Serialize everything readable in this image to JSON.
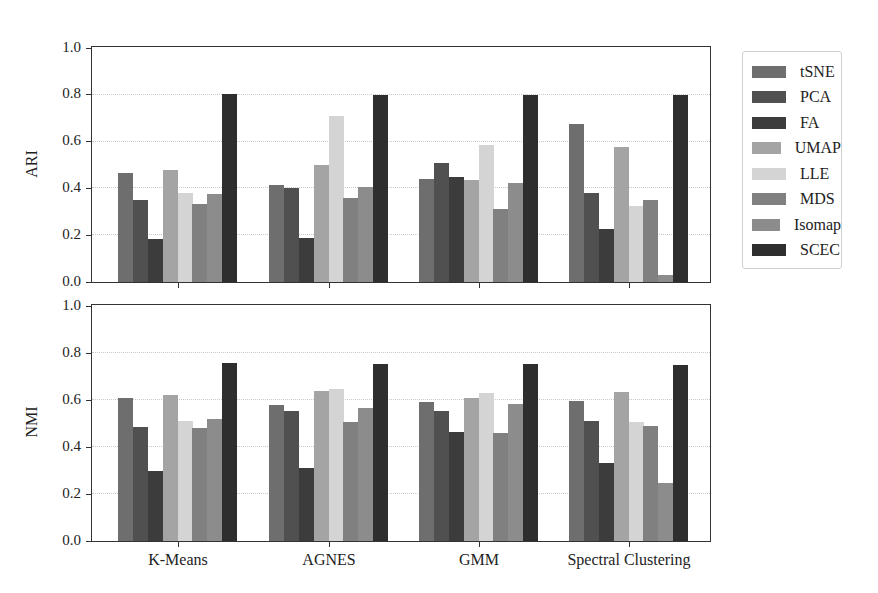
{
  "chart_data": [
    {
      "type": "bar",
      "title": "",
      "xlabel": "",
      "ylabel": "ARI",
      "ylim": [
        0,
        1.0
      ],
      "yticks": [
        "0.0",
        "0.2",
        "0.4",
        "0.6",
        "0.8",
        "1.0"
      ],
      "grid": true,
      "categories": [
        "K-Means",
        "AGNES",
        "GMM",
        "Spectral Clustering"
      ],
      "series": [
        {
          "name": "tSNE",
          "color": "#6e6e6e",
          "values": [
            0.465,
            0.415,
            0.44,
            0.675
          ]
        },
        {
          "name": "PCA",
          "color": "#505050",
          "values": [
            0.35,
            0.4,
            0.51,
            0.38
          ]
        },
        {
          "name": "FA",
          "color": "#3c3c3c",
          "values": [
            0.185,
            0.19,
            0.45,
            0.225
          ]
        },
        {
          "name": "UMAP",
          "color": "#a4a4a4",
          "values": [
            0.48,
            0.5,
            0.435,
            0.575
          ]
        },
        {
          "name": "LLE",
          "color": "#d4d4d4",
          "values": [
            0.38,
            0.71,
            0.585,
            0.325
          ]
        },
        {
          "name": "MDS",
          "color": "#808080",
          "values": [
            0.335,
            0.36,
            0.31,
            0.35
          ]
        },
        {
          "name": "Isomap",
          "color": "#8c8c8c",
          "values": [
            0.375,
            0.405,
            0.425,
            0.03
          ]
        },
        {
          "name": "SCEC",
          "color": "#2e2e2e",
          "values": [
            0.805,
            0.8,
            0.8,
            0.8
          ]
        }
      ]
    },
    {
      "type": "bar",
      "title": "",
      "xlabel": "",
      "ylabel": "NMI",
      "ylim": [
        0,
        1.0
      ],
      "yticks": [
        "0.0",
        "0.2",
        "0.4",
        "0.6",
        "0.8",
        "1.0"
      ],
      "grid": true,
      "categories": [
        "K-Means",
        "AGNES",
        "GMM",
        "Spectral Clustering"
      ],
      "series": [
        {
          "name": "tSNE",
          "color": "#6e6e6e",
          "values": [
            0.61,
            0.58,
            0.59,
            0.597
          ]
        },
        {
          "name": "PCA",
          "color": "#505050",
          "values": [
            0.487,
            0.555,
            0.552,
            0.51
          ]
        },
        {
          "name": "FA",
          "color": "#3c3c3c",
          "values": [
            0.297,
            0.31,
            0.465,
            0.33
          ]
        },
        {
          "name": "UMAP",
          "color": "#a4a4a4",
          "values": [
            0.62,
            0.64,
            0.61,
            0.635
          ]
        },
        {
          "name": "LLE",
          "color": "#d4d4d4",
          "values": [
            0.51,
            0.645,
            0.63,
            0.507
          ]
        },
        {
          "name": "MDS",
          "color": "#808080",
          "values": [
            0.48,
            0.505,
            0.46,
            0.49
          ]
        },
        {
          "name": "Isomap",
          "color": "#8c8c8c",
          "values": [
            0.52,
            0.567,
            0.583,
            0.248
          ]
        },
        {
          "name": "SCEC",
          "color": "#2e2e2e",
          "values": [
            0.757,
            0.755,
            0.752,
            0.75
          ]
        }
      ]
    }
  ],
  "legend": {
    "position": "upper right outside",
    "items": [
      "tSNE",
      "PCA",
      "FA",
      "UMAP",
      "LLE",
      "MDS",
      "Isomap",
      "SCEC"
    ]
  }
}
